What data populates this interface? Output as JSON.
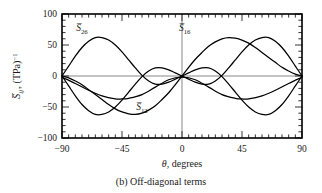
{
  "figure": {
    "caption": "(b) Off-diagonal terms"
  },
  "chart_data": {
    "type": "line",
    "title": "",
    "caption": "(b) Off-diagonal terms",
    "xlabel": "θ, degrees",
    "ylabel": "S̅ij', (TPa)⁻¹",
    "ylabel_parts": {
      "symbol": "S",
      "subscript": "ij′,",
      "units": " (TPa)",
      "units_exponent": "−1"
    },
    "xlim": [
      -90,
      90
    ],
    "ylim": [
      -100,
      100
    ],
    "xticks": [
      -90,
      -45,
      0,
      45,
      90
    ],
    "xtick_labels": [
      "−90",
      "−45",
      "0",
      "45",
      "90"
    ],
    "yticks": [
      -100,
      -50,
      0,
      50,
      100
    ],
    "ytick_labels": [
      "−100",
      "−50",
      "0",
      "50",
      "100"
    ],
    "xminor_interval": 5,
    "yminor_interval": 10,
    "grid": false,
    "legend": "inline-annotations",
    "zero_line": true,
    "annotations": [
      {
        "name": "S26-label",
        "text": "S̅26",
        "symbol": "S",
        "subscript": "26",
        "x": -75,
        "y": 72
      },
      {
        "name": "S16-label",
        "text": "S̅16",
        "symbol": "S",
        "subscript": "16",
        "x": 2,
        "y": 72
      },
      {
        "name": "S12-label",
        "text": "S̅12",
        "symbol": "S",
        "subscript": "12",
        "x": -30,
        "y": -55
      }
    ],
    "series": [
      {
        "name": "S̅26",
        "symbol": "S",
        "subscript": "26",
        "color": "#000000",
        "x": [
          -90,
          -85,
          -80,
          -75,
          -70,
          -65,
          -60,
          -55,
          -50,
          -45,
          -40,
          -35,
          -30,
          -25,
          -20,
          -15,
          -10,
          -5,
          0,
          5,
          10,
          15,
          20,
          25,
          30,
          35,
          40,
          45,
          50,
          55,
          60,
          65,
          70,
          75,
          80,
          85,
          90
        ],
        "values": [
          0,
          16,
          32,
          46,
          56,
          62,
          62,
          58,
          50,
          39,
          26,
          13,
          1,
          -8,
          -13,
          -13,
          -10,
          -5,
          0,
          5,
          10,
          13,
          13,
          8,
          -1,
          -13,
          -26,
          -39,
          -50,
          -58,
          -62,
          -62,
          -56,
          -46,
          -32,
          -16,
          0
        ]
      },
      {
        "name": "S̅16",
        "symbol": "S",
        "subscript": "16",
        "color": "#000000",
        "x": [
          -90,
          -85,
          -80,
          -75,
          -70,
          -65,
          -60,
          -55,
          -50,
          -45,
          -40,
          -35,
          -30,
          -25,
          -20,
          -15,
          -10,
          -5,
          0,
          5,
          10,
          15,
          20,
          25,
          30,
          35,
          40,
          45,
          50,
          55,
          60,
          65,
          70,
          75,
          80,
          85,
          90
        ],
        "values": [
          0,
          -16,
          -32,
          -46,
          -56,
          -62,
          -62,
          -58,
          -50,
          -39,
          -26,
          -13,
          -1,
          8,
          13,
          13,
          10,
          5,
          0,
          -5,
          -10,
          -13,
          -13,
          -8,
          1,
          13,
          26,
          39,
          50,
          58,
          62,
          62,
          56,
          46,
          32,
          16,
          0
        ]
      },
      {
        "name": "S̅12",
        "symbol": "S",
        "subscript": "12",
        "color": "#000000",
        "x": [
          -90,
          -80,
          -70,
          -60,
          -50,
          -45,
          -40,
          -30,
          -20,
          -10,
          0,
          10,
          20,
          30,
          40,
          45,
          50,
          60,
          70,
          80,
          90
        ],
        "values": [
          -2,
          -12,
          -23,
          -32,
          -37,
          -37,
          -36,
          -30,
          -18,
          -6,
          -2,
          -6,
          -18,
          -30,
          -36,
          -37,
          -37,
          -32,
          -23,
          -12,
          -2
        ]
      },
      {
        "name": "S̅26-mirror",
        "symbol": "S",
        "subscript": "26",
        "color": "#000000",
        "x": [
          -90,
          -85,
          -80,
          -75,
          -70,
          -65,
          -60,
          -55,
          -50,
          -45,
          -40,
          -35,
          -30,
          -25,
          -20,
          -15,
          -10,
          -5,
          0,
          5,
          10,
          15,
          20,
          25,
          30,
          35,
          40,
          45,
          50,
          55,
          60,
          65,
          70,
          75,
          80,
          85,
          90
        ],
        "values": [
          0,
          -3,
          -8,
          -14,
          -22,
          -30,
          -38,
          -46,
          -53,
          -58,
          -61,
          -62,
          -60,
          -55,
          -48,
          -38,
          -27,
          -14,
          0,
          14,
          27,
          38,
          48,
          55,
          60,
          62,
          61,
          58,
          53,
          46,
          38,
          30,
          22,
          14,
          8,
          3,
          0
        ]
      }
    ]
  }
}
